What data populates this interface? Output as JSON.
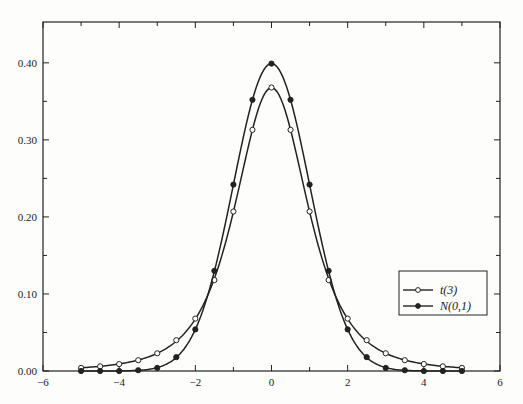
{
  "chart_data": {
    "type": "line",
    "title": "",
    "xlabel": "",
    "ylabel": "",
    "xlim": [
      -6,
      6
    ],
    "ylim": [
      0,
      0.453
    ],
    "grid": false,
    "legend_position": "lower right (inside plot)",
    "x_ticks": [
      -6,
      -4,
      -2,
      0,
      2,
      4,
      6
    ],
    "x_tick_labels": [
      "−6",
      "−4",
      "−2",
      "0",
      "2",
      "4",
      "6"
    ],
    "x_minor_ticks": [
      -5,
      -3,
      -1,
      1,
      3,
      5
    ],
    "y_ticks": [
      0.0,
      0.1,
      0.2,
      0.3,
      0.4
    ],
    "y_tick_labels": [
      "0.00",
      "0.10",
      "0.20",
      "0.30",
      "0.40"
    ],
    "y_minor_ticks": [
      0.05,
      0.15,
      0.25,
      0.35
    ],
    "x": [
      -5,
      -4.5,
      -4,
      -3.5,
      -3,
      -2.5,
      -2,
      -1.5,
      -1,
      -0.5,
      0,
      0.5,
      1,
      1.5,
      2,
      2.5,
      3,
      3.5,
      4,
      4.5,
      5
    ],
    "series": [
      {
        "name": "t(3)",
        "marker": "open-circle",
        "values": [
          0.004,
          0.006,
          0.009,
          0.014,
          0.023,
          0.04,
          0.068,
          0.118,
          0.207,
          0.313,
          0.368,
          0.313,
          0.207,
          0.118,
          0.068,
          0.04,
          0.023,
          0.014,
          0.009,
          0.006,
          0.004
        ]
      },
      {
        "name": "N(0,1)",
        "marker": "filled-circle",
        "values": [
          0.0,
          0.0,
          0.0,
          0.001,
          0.004,
          0.018,
          0.054,
          0.13,
          0.242,
          0.352,
          0.399,
          0.352,
          0.242,
          0.13,
          0.054,
          0.018,
          0.004,
          0.001,
          0.0,
          0.0,
          0.0
        ]
      }
    ]
  },
  "legend": {
    "items": [
      {
        "label": "t(3)",
        "marker": "open-circle"
      },
      {
        "label": "N(0,1)",
        "marker": "filled-circle"
      }
    ]
  },
  "colors": {
    "line": "#222222",
    "background": "#fdfdfb"
  }
}
